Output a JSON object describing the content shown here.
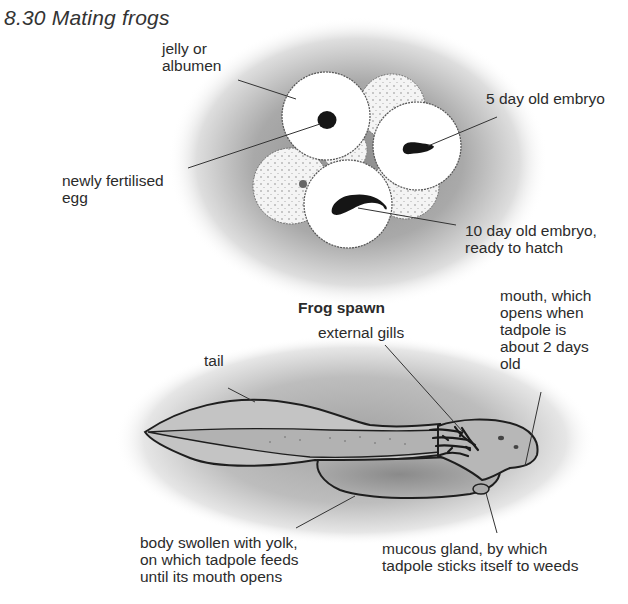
{
  "figure": {
    "title": "8.30 Mating frogs"
  },
  "frog_spawn": {
    "caption": "Frog spawn",
    "labels": {
      "jelly": [
        "jelly or",
        "albumen"
      ],
      "fertilised_egg": [
        "newly fertilised",
        "egg"
      ],
      "embryo_5day": [
        "5 day old embryo"
      ],
      "embryo_10day": [
        "10 day old embryo,",
        "ready to hatch"
      ]
    }
  },
  "tadpole": {
    "labels": {
      "tail": [
        "tail"
      ],
      "external_gills": [
        "external gills"
      ],
      "mouth": [
        "mouth, which",
        "opens when",
        "tadpole is",
        "about 2 days",
        "old"
      ],
      "yolk_body": [
        "body swollen with yolk,",
        "on which tadpole feeds",
        "until its mouth opens"
      ],
      "mucous_gland": [
        "mucous gland, by which",
        "tadpole sticks itself to weeds"
      ]
    }
  },
  "colors": {
    "ink": "#1e1e1e",
    "shade": "#9a9a9a",
    "tadpole_fill": "#b9b9b9",
    "egg_white": "#ffffff"
  }
}
